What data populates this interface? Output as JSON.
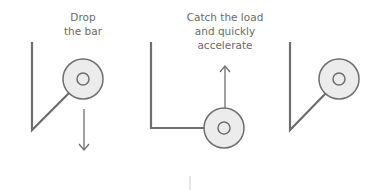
{
  "diagram": {
    "panels": [
      {
        "id": "drop",
        "label_lines": [
          "Drop",
          "the bar"
        ],
        "arrow_direction": "down"
      },
      {
        "id": "catch",
        "label_lines": [
          "Catch the load",
          "and quickly",
          "accelerate"
        ],
        "arrow_direction": "up"
      },
      {
        "id": "release",
        "label_lines": [],
        "arrow_direction": "none"
      }
    ],
    "colors": {
      "line": "#6e6e6e",
      "disc_fill": "#ececec",
      "text": "#6b6b6b"
    }
  }
}
